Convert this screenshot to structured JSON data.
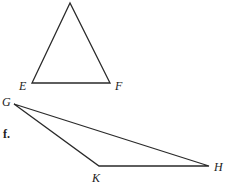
{
  "triangles": [
    {
      "name": "triangle-EF",
      "vertices": [
        {
          "label": "",
          "x": 70,
          "y": 3
        },
        {
          "label": "E",
          "x": 32,
          "y": 83
        },
        {
          "label": "F",
          "x": 110,
          "y": 83
        }
      ],
      "labels": {
        "E": "E",
        "F": "F"
      }
    },
    {
      "name": "triangle-GKH",
      "vertices": [
        {
          "label": "G",
          "x": 14,
          "y": 104
        },
        {
          "label": "K",
          "x": 99,
          "y": 166
        },
        {
          "label": "H",
          "x": 209,
          "y": 166
        }
      ],
      "labels": {
        "G": "G",
        "K": "K",
        "H": "H"
      }
    }
  ],
  "part_label": "f."
}
